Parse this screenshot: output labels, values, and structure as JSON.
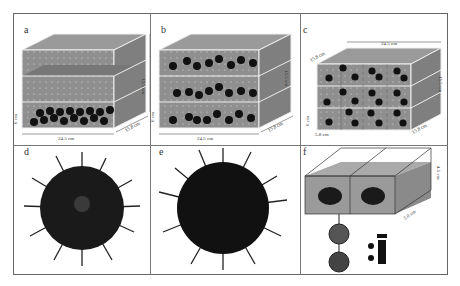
{
  "figure": {
    "panels": [
      {
        "id": "a",
        "label": "a",
        "type": "tank-diagram",
        "arrangement": "urchins on bottom layer only",
        "dims": {
          "length": "24.5 cm",
          "width": "15.8 cm",
          "height": "15.5 cm",
          "layer": "6 cm"
        }
      },
      {
        "id": "b",
        "label": "b",
        "type": "tank-diagram",
        "arrangement": "urchins spread across three layers",
        "dims": {
          "length": "24.5 cm",
          "width": "15.8 cm",
          "height": "15.5 cm",
          "layer": "6 cm"
        }
      },
      {
        "id": "c",
        "label": "c",
        "type": "tank-diagram",
        "arrangement": "urchins in separated compartments on three layers",
        "dims": {
          "length": "24.5 cm",
          "width": "15.8 cm",
          "height": "15.5 cm",
          "layer": "6 cm",
          "compartment": "5.8 cm",
          "depth_top": "15.8 cm"
        }
      },
      {
        "id": "d",
        "label": "d",
        "type": "photo",
        "subject": "sea urchin (oral view)"
      },
      {
        "id": "e",
        "label": "e",
        "type": "photo",
        "subject": "sea urchin (aboral view)"
      },
      {
        "id": "f",
        "label": "f",
        "type": "tank-diagram",
        "arrangement": "two chambers with individual urchins",
        "dims": {
          "length": "4.8 cm",
          "height": "4.5 cm",
          "width": "5.0 cm"
        }
      }
    ]
  },
  "labels": {
    "a": "a",
    "b": "b",
    "c": "c",
    "d": "d",
    "e": "e",
    "f": "f",
    "len": "24.5 cm",
    "wid": "15.8 cm",
    "hei": "15.5 cm",
    "layer": "6 cm",
    "comp": "5.8 cm",
    "f_len": "4.8 cm",
    "f_hei": "4.5 cm",
    "f_wid": "5.0 cm"
  },
  "colors": {
    "tank": "#8f8f8f",
    "tank_dark": "#7a7a7a",
    "urchin": "#111111",
    "water": "#9a9a9a",
    "frame": "#666666"
  }
}
